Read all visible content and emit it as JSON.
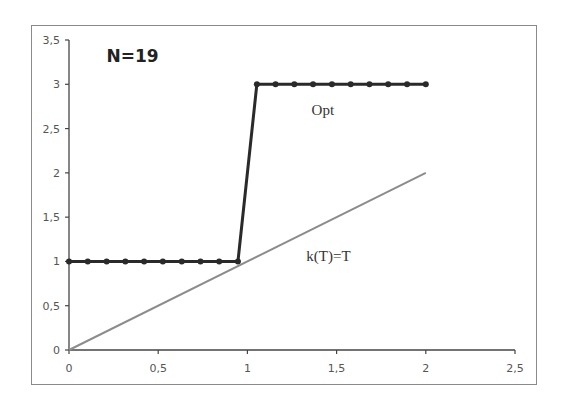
{
  "chart_data": {
    "type": "line",
    "title": "N=19",
    "xlabel": "",
    "ylabel": "",
    "xlim": [
      0,
      2.5
    ],
    "ylim": [
      0,
      3.5
    ],
    "x_ticks": [
      0,
      0.5,
      1,
      1.5,
      2,
      2.5
    ],
    "x_tick_labels": [
      "0",
      "0,5",
      "1",
      "1,5",
      "2",
      "2,5"
    ],
    "y_ticks": [
      0,
      0.5,
      1,
      1.5,
      2,
      2.5,
      3,
      3.5
    ],
    "y_tick_labels": [
      "0",
      "0,5",
      "1",
      "1,5",
      "2",
      "2,5",
      "3",
      "3,5"
    ],
    "grid": false,
    "legend": "none (inline annotations)",
    "series": [
      {
        "name": "Opt",
        "color": "#2a2a2a",
        "markers": true,
        "x": [
          0,
          0.105,
          0.211,
          0.316,
          0.421,
          0.526,
          0.632,
          0.737,
          0.842,
          0.947,
          1.053,
          1.158,
          1.263,
          1.368,
          1.474,
          1.579,
          1.684,
          1.789,
          1.895,
          2.0
        ],
        "values": [
          1,
          1,
          1,
          1,
          1,
          1,
          1,
          1,
          1,
          1,
          3,
          3,
          3,
          3,
          3,
          3,
          3,
          3,
          3,
          3
        ]
      },
      {
        "name": "k(T)=T",
        "color": "#8c8c8c",
        "markers": false,
        "x": [
          0,
          2
        ],
        "values": [
          0,
          2
        ]
      }
    ],
    "annotations": [
      {
        "text": "N=19",
        "x": 0.21,
        "y": 3.25,
        "bold": true
      },
      {
        "text": "Opt",
        "x": 1.36,
        "y": 2.65
      },
      {
        "text": "k(T)=T",
        "x": 1.33,
        "y": 1.0
      }
    ]
  }
}
